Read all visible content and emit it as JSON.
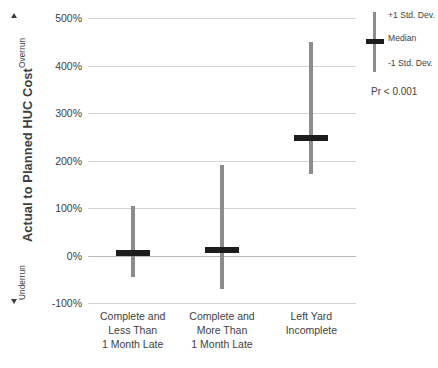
{
  "chart_data": {
    "type": "bar",
    "title": "",
    "xlabel": "",
    "ylabel": "Actual to Planned HUC Cost",
    "ylim": [
      -100,
      500
    ],
    "ytick_labels": [
      "500%",
      "400%",
      "300%",
      "200%",
      "100%",
      "0%",
      "-100%"
    ],
    "ytick_values": [
      500,
      400,
      300,
      200,
      100,
      0,
      -100
    ],
    "grid": true,
    "categories": [
      "Complete and Less Than 1 Month Late",
      "Complete and More Than 1 Month Late",
      "Left Yard Incomplete"
    ],
    "category_lines": [
      [
        "Complete and",
        "Less Than",
        "1 Month Late"
      ],
      [
        "Complete and",
        "More Than",
        "1 Month Late"
      ],
      [
        "Left Yard",
        "Incomplete"
      ]
    ],
    "series": [
      {
        "name": "+1 Std. Dev.",
        "values": [
          105,
          190,
          450
        ]
      },
      {
        "name": "Median",
        "values": [
          5,
          12,
          247
        ]
      },
      {
        "name": "-1 Std. Dev.",
        "values": [
          -45,
          -70,
          172
        ]
      }
    ],
    "annotations": {
      "overrun": "Overrun",
      "underrun": "Underrun",
      "p_value": "Pr < 0.001"
    },
    "legend": {
      "position": "right",
      "entries": [
        "+1 Std. Dev.",
        "Median",
        "-1 Std. Dev."
      ]
    },
    "colors": {
      "whisker": "#8c8c8c",
      "median": "#1c1c1c",
      "gridline": "#d4d4d4",
      "text": "#3f3f3f"
    }
  }
}
